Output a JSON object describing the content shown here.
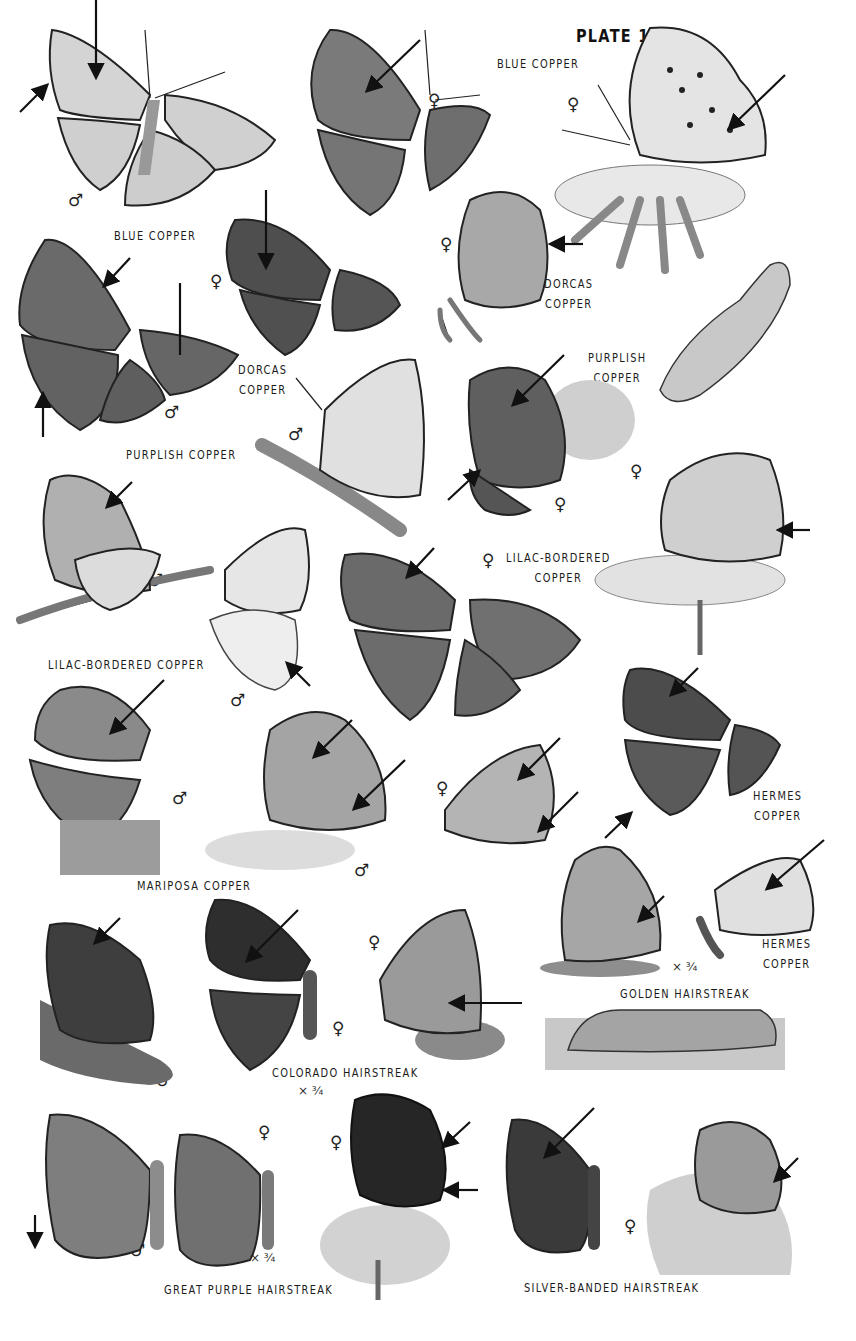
{
  "plate": {
    "title": "PLATE 15",
    "colors": {
      "background": "#ffffff",
      "ink": "#1b1b1b",
      "wing_light": "#d8d8d8",
      "wing_mid": "#9a9a9a",
      "wing_dark": "#4a4a4a"
    },
    "labels": [
      {
        "id": "blue-copper-top",
        "lines": [
          "BLUE COPPER"
        ]
      },
      {
        "id": "blue-copper-left",
        "lines": [
          "BLUE COPPER"
        ]
      },
      {
        "id": "dorcas-copper-right",
        "lines": [
          "DORCAS",
          "COPPER"
        ]
      },
      {
        "id": "dorcas-copper-left",
        "lines": [
          "DORCAS",
          "COPPER"
        ]
      },
      {
        "id": "purplish-copper-right",
        "lines": [
          "PURPLISH",
          "COPPER"
        ]
      },
      {
        "id": "purplish-copper-left",
        "lines": [
          "PURPLISH COPPER"
        ]
      },
      {
        "id": "lilac-bordered-copper-right",
        "lines": [
          "LILAC-BORDERED",
          "COPPER"
        ]
      },
      {
        "id": "lilac-bordered-copper-left",
        "lines": [
          "LILAC-BORDERED COPPER"
        ]
      },
      {
        "id": "mariposa-copper",
        "lines": [
          "MARIPOSA COPPER"
        ]
      },
      {
        "id": "hermes-copper-top",
        "lines": [
          "HERMES",
          "COPPER"
        ]
      },
      {
        "id": "hermes-copper-bottom",
        "lines": [
          "HERMES",
          "COPPER"
        ]
      },
      {
        "id": "golden-hairstreak",
        "lines": [
          "GOLDEN HAIRSTREAK"
        ]
      },
      {
        "id": "colorado-hairstreak",
        "lines": [
          "COLORADO HAIRSTREAK"
        ]
      },
      {
        "id": "great-purple-hairstreak",
        "lines": [
          "GREAT PURPLE HAIRSTREAK"
        ]
      },
      {
        "id": "silver-banded-hairstreak",
        "lines": [
          "SILVER-BANDED HAIRSTREAK"
        ]
      }
    ],
    "sex_symbols": {
      "male": "♂",
      "female": "♀"
    },
    "scale_notes": {
      "three_quarter": "× ¾"
    },
    "figures": [
      {
        "species": "Blue Copper",
        "sex": "male",
        "view": "upperside"
      },
      {
        "species": "Blue Copper",
        "sex": "female",
        "view": "upperside"
      },
      {
        "species": "Blue Copper",
        "sex": "female",
        "view": "underside on flower"
      },
      {
        "species": "Dorcas Copper",
        "sex": "female",
        "view": "upperside"
      },
      {
        "species": "Dorcas Copper",
        "sex": "female",
        "view": "underside"
      },
      {
        "species": "Purplish Copper",
        "sex": "male",
        "view": "upperside"
      },
      {
        "species": "Purplish Copper",
        "sex": "male",
        "view": "underside"
      },
      {
        "species": "Purplish Copper",
        "sex": "female",
        "view": "upperside on flower"
      },
      {
        "species": "Purplish Copper",
        "sex": "",
        "view": "larva"
      },
      {
        "species": "Lilac-bordered Copper",
        "sex": "male",
        "view": "underside"
      },
      {
        "species": "Lilac-bordered Copper",
        "sex": "male",
        "view": "underside"
      },
      {
        "species": "Lilac-bordered Copper",
        "sex": "female",
        "view": "upperside"
      },
      {
        "species": "Lilac-bordered Copper",
        "sex": "female",
        "view": "underside on flower"
      },
      {
        "species": "Mariposa Copper",
        "sex": "male",
        "view": "upperside"
      },
      {
        "species": "Mariposa Copper",
        "sex": "male",
        "view": "underside"
      },
      {
        "species": "Mariposa Copper",
        "sex": "female",
        "view": "underside"
      },
      {
        "species": "Hermes Copper",
        "sex": "",
        "view": "upperside"
      },
      {
        "species": "Hermes Copper",
        "sex": "",
        "view": "underside"
      },
      {
        "species": "Golden Hairstreak",
        "sex": "",
        "view": "underside",
        "scale": "× ¾"
      },
      {
        "species": "Golden Hairstreak",
        "sex": "",
        "view": "larva"
      },
      {
        "species": "Colorado Hairstreak",
        "sex": "male",
        "view": "upperside"
      },
      {
        "species": "Colorado Hairstreak",
        "sex": "female",
        "view": "upperside",
        "scale": "× ¾"
      },
      {
        "species": "Colorado Hairstreak",
        "sex": "female",
        "view": "underside"
      },
      {
        "species": "Great Purple Hairstreak",
        "sex": "male",
        "view": "upperside"
      },
      {
        "species": "Great Purple Hairstreak",
        "sex": "female",
        "view": "upperside",
        "scale": "× ¾"
      },
      {
        "species": "Great Purple Hairstreak",
        "sex": "female",
        "view": "underside on flower"
      },
      {
        "species": "Silver-banded Hairstreak",
        "sex": "",
        "view": "upperside"
      },
      {
        "species": "Silver-banded Hairstreak",
        "sex": "female",
        "view": "underside"
      }
    ]
  }
}
